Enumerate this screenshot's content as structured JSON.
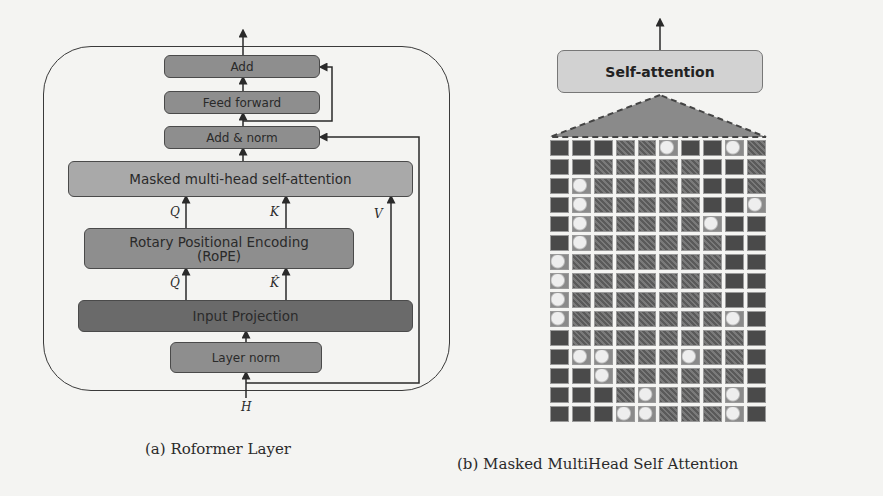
{
  "figure_a": {
    "caption": "(a) Roformer Layer",
    "boxes": {
      "add": "Add",
      "feed_forward": "Feed forward",
      "add_norm": "Add & norm",
      "masked_mhsa": "Masked multi-head self-attention",
      "rope": "Rotary Positional Encoding (RoPE)",
      "input_projection": "Input Projection",
      "layer_norm": "Layer norm"
    },
    "labels": {
      "q": "Q",
      "k": "K",
      "v": "V",
      "q_hat": "Q̂",
      "k_hat": "K̂",
      "h": "H"
    }
  },
  "figure_b": {
    "caption": "(b) Masked MultiHead Self Attention",
    "self_attention_label": "Self-attention",
    "grid": {
      "columns": 10,
      "rows": 15,
      "legend": {
        "D": "masked (dark) patch",
        "P": "image patch",
        "L": "bright image patch"
      },
      "cells": [
        "DDDPPLDDLP",
        "DDPPPPPDDP",
        "DLPPPPPDDP",
        "DLPPPPPDDL",
        "DLPPPPPLDD",
        "DLPPPPPPDD",
        "LPPPPPPPDD",
        "LPPPPPPPDD",
        "LPPPPPPPDD",
        "LPPPPPPPLD",
        "DPPPPPPPPD",
        "DLLPPPLPPD",
        "DDLPPPPPPD",
        "DDDPLPPPLD",
        "DDDLLPPPLD"
      ]
    }
  }
}
